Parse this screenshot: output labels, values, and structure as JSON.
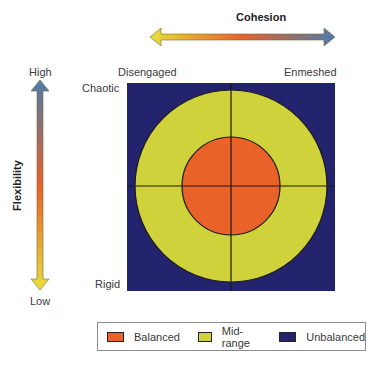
{
  "axes": {
    "cohesion": {
      "title": "Cohesion",
      "low_label": "Disengaged",
      "high_label": "Enmeshed"
    },
    "flexibility": {
      "title": "Flexibility",
      "high_label": "High",
      "low_label": "Low",
      "top_label": "Chaotic",
      "bottom_label": "Rigid"
    }
  },
  "colors": {
    "balanced": "#e8622a",
    "midrange": "#cfd23a",
    "unbalanced": "#23236e",
    "arrow_yellow": "#e7df3a",
    "arrow_orange": "#e8602a",
    "arrow_blue": "#4d7cab"
  },
  "legend": {
    "items": [
      {
        "label": "Balanced",
        "color": "#e8622a"
      },
      {
        "label": "Mid-range",
        "color": "#cfd23a"
      },
      {
        "label": "Unbalanced",
        "color": "#23236e"
      }
    ]
  }
}
